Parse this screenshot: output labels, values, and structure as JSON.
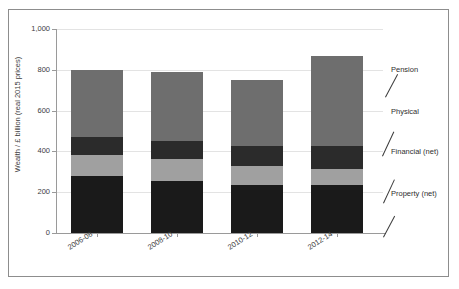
{
  "chart_data": {
    "type": "bar",
    "stacked": true,
    "title": "",
    "subtitle": "",
    "xlabel": "",
    "ylabel": "Wealth / £ billion (real 2015 prices)",
    "categories": [
      "2006-08",
      "2008-10",
      "2010-12",
      "2012-14"
    ],
    "ylim": [
      0,
      1000
    ],
    "yticks": [
      0,
      200,
      400,
      600,
      800,
      1000
    ],
    "ytick_labels": [
      "0",
      "200",
      "400",
      "600",
      "800",
      "1,000"
    ],
    "grid": true,
    "legend_position": "right-outside",
    "series": [
      {
        "name": "Property (net)",
        "color": "#1a1a1a",
        "values": [
          280,
          255,
          235,
          235
        ]
      },
      {
        "name": "Financial (net)",
        "color": "#a0a0a0",
        "values": [
          103,
          108,
          94,
          79
        ]
      },
      {
        "name": "Physical",
        "color": "#2b2b2b",
        "values": [
          87,
          88,
          98,
          113
        ]
      },
      {
        "name": "Pension",
        "color": "#6e6e6e",
        "values": [
          330,
          339,
          323,
          443
        ]
      }
    ],
    "totals": [
      800,
      790,
      750,
      870
    ],
    "annotations": [
      {
        "label": "Pension",
        "target_series": "Pension"
      },
      {
        "label": "Physical",
        "target_series": "Physical"
      },
      {
        "label": "Financial (net)",
        "target_series": "Financial (net)"
      },
      {
        "label": "Property (net)",
        "target_series": "Property (net)"
      }
    ]
  },
  "axis": {
    "y_title": "Wealth / £ billion (real 2015 prices)",
    "y_tick_0": "0",
    "y_tick_1": "200",
    "y_tick_2": "400",
    "y_tick_3": "600",
    "y_tick_4": "800",
    "y_tick_5": "1,000",
    "x_tick_0": "2006-08",
    "x_tick_1": "2008-10",
    "x_tick_2": "2010-12",
    "x_tick_3": "2012-14"
  },
  "legend": {
    "item_0": "Pension",
    "item_1": "Physical",
    "item_2": "Financial (net)",
    "item_3": "Property (net)"
  },
  "colors": {
    "pension": "#6e6e6e",
    "physical": "#2b2b2b",
    "financial": "#a0a0a0",
    "property": "#1a1a1a",
    "gridline": "#e3e3e3",
    "axis": "#9a9a9a",
    "frame": "#8d8d8d",
    "background": "#ffffff",
    "text": "#3d3d3d"
  }
}
